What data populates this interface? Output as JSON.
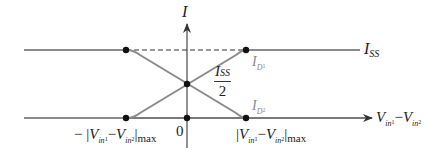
{
  "diagram": {
    "type": "differential-pair-transfer-characteristic",
    "y_axis": {
      "label": "I"
    },
    "x_axis": {
      "label_main": "V",
      "label_sub1": "in",
      "label_subsub1": "1",
      "label_minus": "−",
      "label_sub2": "in",
      "label_subsub2": "2",
      "origin_label": "0"
    },
    "level_labels": {
      "iss": {
        "main": "I",
        "sub": "SS"
      },
      "half_iss": {
        "num_main": "I",
        "num_sub": "SS",
        "den": "2"
      },
      "id1": {
        "main": "I",
        "sub": "D",
        "subsub": "1"
      },
      "id2": {
        "main": "I",
        "sub": "D",
        "subsub": "2"
      }
    },
    "tick_labels": {
      "neg_max": {
        "prefix": "− |",
        "v1": "V",
        "s1": "in",
        "ss1": "1",
        "minus": "−",
        "v2": "V",
        "s2": "in",
        "ss2": "2",
        "suffix": "|",
        "max": "max"
      },
      "pos_max": {
        "prefix": "|",
        "v1": "V",
        "s1": "in",
        "ss1": "1",
        "minus": "−",
        "v2": "V",
        "s2": "in",
        "ss2": "2",
        "suffix": "|",
        "max": "max"
      }
    },
    "colors": {
      "curve": "#8c8c8c",
      "axis": "#555555",
      "dot": "#111111",
      "dashed": "#333333"
    }
  }
}
